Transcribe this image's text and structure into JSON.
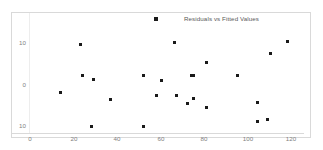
{
  "chart_data": {
    "type": "scatter",
    "title": "",
    "legend": {
      "position": "top-center",
      "entries": [
        {
          "label": "Residuals vs Fitted Values",
          "marker": "square",
          "color": "#1a1a1a"
        }
      ]
    },
    "xlabel": "",
    "ylabel": "",
    "xlim": [
      0,
      120
    ],
    "ylim": [
      -12,
      13
    ],
    "xticks": [
      0,
      20,
      40,
      60,
      80,
      100,
      120
    ],
    "xtick_labels": [
      "0",
      "20",
      "40",
      "60",
      "80",
      "100",
      "120"
    ],
    "yticks": [
      10,
      0,
      -10
    ],
    "ytick_labels": [
      "10",
      "0",
      "10"
    ],
    "grid": false,
    "series": [
      {
        "name": "Residuals vs Fitted Values",
        "color": "#1a1a1a",
        "x": [
          14,
          23,
          24,
          28,
          29,
          37,
          52,
          52,
          58,
          60,
          66,
          67,
          72,
          74,
          75,
          75,
          81,
          81,
          95,
          104,
          104,
          109,
          110,
          118
        ],
        "y": [
          -1.8,
          9.8,
          2.4,
          -10.2,
          1.3,
          -3.5,
          2.3,
          -10.2,
          -2.5,
          1.2,
          10.3,
          -2.5,
          -4.6,
          2.4,
          -3.3,
          2.4,
          5.6,
          -5.5,
          2.3,
          -4.3,
          -8.9,
          -8.5,
          7.6,
          10.5
        ]
      }
    ]
  },
  "axes": {
    "y_labels": [
      "10",
      "0",
      "10"
    ],
    "x_labels": [
      "0",
      "20",
      "40",
      "60",
      "80",
      "100",
      "120"
    ]
  },
  "legend": {
    "label": "Residuals vs Fitted Values"
  },
  "colors": {
    "marker": "#181818",
    "frame": "#d9d9d9",
    "tick_text": "#7f7f7f",
    "legend_text": "#595959",
    "background": "#ffffff"
  }
}
